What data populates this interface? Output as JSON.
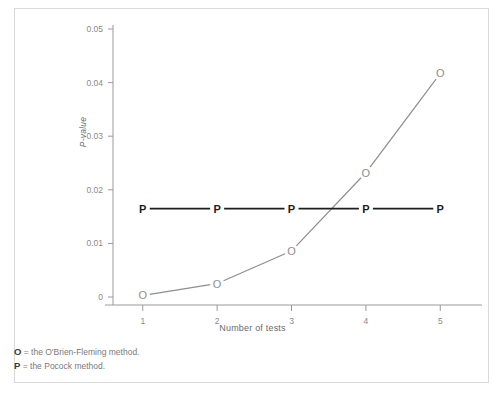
{
  "figure": {
    "clipped_header_text": "",
    "border_color": "#d9d9d9",
    "background": "#ffffff"
  },
  "axes": {
    "y_label": "P-value",
    "y_ticks": [
      "0.05",
      "0.04",
      "0.03",
      "0.02",
      "0.01",
      "0"
    ],
    "x_label": "Number of tests",
    "x_ticks": [
      "1",
      "2",
      "3",
      "4",
      "5"
    ]
  },
  "legend_notes": [
    {
      "key": "O",
      "sep": " = ",
      "text": "the O'Brien-Fleming method."
    },
    {
      "key": "P",
      "sep": " = ",
      "text": "the Pocock method."
    }
  ],
  "colors": {
    "obrien_fleming": "#8e8e8e",
    "pocock": "#1d1d1d",
    "axis": "#9a9a9a",
    "tick_text": "#8a8a8a"
  },
  "chart_data": {
    "type": "line",
    "title": "",
    "xlabel": "Number of tests",
    "ylabel": "P-value",
    "x": [
      1,
      2,
      3,
      4,
      5
    ],
    "xlim": [
      0.6,
      5.4
    ],
    "ylim": [
      0,
      0.05
    ],
    "grid": false,
    "legend_position": "below-plot",
    "y_tick_values": [
      0,
      0.01,
      0.02,
      0.03,
      0.04,
      0.05
    ],
    "series": [
      {
        "name": "O = the O'Brien-Fleming method.",
        "marker": "O",
        "color": "#8e8e8e",
        "values": [
          0.0003,
          0.0025,
          0.0086,
          0.0232,
          0.0417
        ]
      },
      {
        "name": "P = the Pocock method.",
        "marker": "P",
        "color": "#1d1d1d",
        "values": [
          0.0165,
          0.0165,
          0.0165,
          0.0165,
          0.0165
        ]
      }
    ]
  }
}
